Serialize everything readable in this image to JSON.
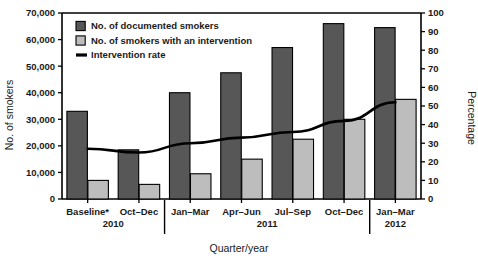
{
  "chart_data": {
    "type": "bar",
    "title": "",
    "xlabel": "Quarter/year",
    "ylabel": "No. of smokers",
    "y2label": "Percentage",
    "categories": [
      "Baseline*",
      "Oct–Dec",
      "Jan–Mar",
      "Apr–Jun",
      "Jul–Sep",
      "Oct–Dec",
      "Jan–Mar"
    ],
    "group_years": [
      {
        "label": "2010",
        "from": 0,
        "to": 1
      },
      {
        "label": "2011",
        "from": 2,
        "to": 5
      },
      {
        "label": "2012",
        "from": 6,
        "to": 6
      }
    ],
    "series": [
      {
        "name": "No. of documented smokers",
        "axis": "left",
        "kind": "bar",
        "color": "#575757",
        "values": [
          33000,
          18500,
          40000,
          47500,
          57000,
          66000,
          64500
        ]
      },
      {
        "name": "No. of smokers with an intervention",
        "axis": "left",
        "kind": "bar",
        "color": "#bdbdbd",
        "values": [
          7000,
          5500,
          9500,
          15000,
          22500,
          30000,
          37500
        ]
      },
      {
        "name": "Intervention rate",
        "axis": "right",
        "kind": "line",
        "color": "#000000",
        "values": [
          27,
          25,
          30,
          33,
          36,
          42,
          52
        ]
      }
    ],
    "ylim": [
      0,
      70000
    ],
    "y2lim": [
      0,
      100
    ],
    "yticks": [
      0,
      10000,
      20000,
      30000,
      40000,
      50000,
      60000,
      70000
    ],
    "ytick_labels": [
      "0",
      "10,000",
      "20,000",
      "30,000",
      "40,000",
      "50,000",
      "60,000",
      "70,000"
    ],
    "y2ticks": [
      0,
      10,
      20,
      30,
      40,
      50,
      60,
      70,
      80,
      90,
      100
    ],
    "y2tick_labels": [
      "0",
      "10",
      "20",
      "30",
      "40",
      "50",
      "60",
      "70",
      "80",
      "90",
      "100"
    ],
    "grid": false,
    "legend_position": "top-left"
  },
  "legend": {
    "items": [
      {
        "label": "No. of documented smokers",
        "marker": "square-dark"
      },
      {
        "label": "No. of smokers with an intervention",
        "marker": "square-light"
      },
      {
        "label": "Intervention rate",
        "marker": "line"
      }
    ]
  },
  "axes": {
    "left_title": "No. of smokers",
    "right_title": "Percentage",
    "bottom_title": "Quarter/year"
  }
}
